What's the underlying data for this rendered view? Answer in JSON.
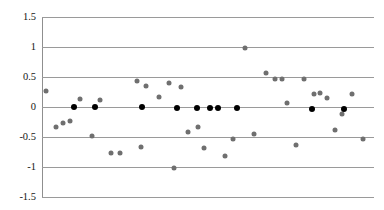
{
  "chart_data": {
    "type": "scatter",
    "title": "",
    "xlabel": "",
    "ylabel": "",
    "ylim": [
      -1.5,
      1.5
    ],
    "xlim": [
      0,
      100
    ],
    "grid": true,
    "legend": false,
    "ytick_labels": [
      "1.5",
      "1",
      "0.5",
      "0",
      "-0.5",
      "-1",
      "-1.5"
    ],
    "ytick_values": [
      1.5,
      1.0,
      0.5,
      0.0,
      -0.5,
      -1.0,
      -1.5
    ],
    "xtick_labels": [],
    "series": [
      {
        "name": "gray-points",
        "color": "#6f6f6f",
        "marker": "circle",
        "points": [
          {
            "x": 1.2,
            "y": 0.26
          },
          {
            "x": 4.2,
            "y": -0.33
          },
          {
            "x": 6.3,
            "y": -0.26
          },
          {
            "x": 8.4,
            "y": -0.24
          },
          {
            "x": 11.4,
            "y": 0.13
          },
          {
            "x": 15.1,
            "y": -0.49
          },
          {
            "x": 17.5,
            "y": 0.12
          },
          {
            "x": 20.8,
            "y": -0.76
          },
          {
            "x": 23.5,
            "y": -0.76
          },
          {
            "x": 28.6,
            "y": 0.43
          },
          {
            "x": 29.8,
            "y": -0.67
          },
          {
            "x": 31.3,
            "y": 0.35
          },
          {
            "x": 35.2,
            "y": 0.17
          },
          {
            "x": 38.2,
            "y": 0.4
          },
          {
            "x": 39.8,
            "y": -1.02
          },
          {
            "x": 41.8,
            "y": 0.33
          },
          {
            "x": 44.0,
            "y": -0.41
          },
          {
            "x": 46.9,
            "y": -0.34
          },
          {
            "x": 48.8,
            "y": -0.68
          },
          {
            "x": 55.0,
            "y": -0.82
          },
          {
            "x": 57.4,
            "y": -0.53
          },
          {
            "x": 61.0,
            "y": 0.99
          },
          {
            "x": 64.0,
            "y": -0.45
          },
          {
            "x": 67.6,
            "y": 0.56
          },
          {
            "x": 70.3,
            "y": 0.47
          },
          {
            "x": 72.4,
            "y": 0.47
          },
          {
            "x": 73.8,
            "y": 0.06
          },
          {
            "x": 76.5,
            "y": -0.64
          },
          {
            "x": 79.0,
            "y": 0.47
          },
          {
            "x": 81.9,
            "y": 0.22
          },
          {
            "x": 83.7,
            "y": 0.23
          },
          {
            "x": 85.8,
            "y": 0.15
          },
          {
            "x": 88.3,
            "y": -0.38
          },
          {
            "x": 90.4,
            "y": -0.12
          },
          {
            "x": 93.5,
            "y": 0.21
          },
          {
            "x": 96.6,
            "y": -0.53
          }
        ]
      },
      {
        "name": "black-points",
        "color": "#000000",
        "marker": "circle",
        "points": [
          {
            "x": 9.5,
            "y": 0.0
          },
          {
            "x": 16.1,
            "y": 0.0
          },
          {
            "x": 30.1,
            "y": 0.0
          },
          {
            "x": 40.6,
            "y": -0.02
          },
          {
            "x": 46.6,
            "y": -0.02
          },
          {
            "x": 50.7,
            "y": -0.02
          },
          {
            "x": 52.9,
            "y": -0.02
          },
          {
            "x": 58.7,
            "y": -0.02
          },
          {
            "x": 81.3,
            "y": -0.04
          },
          {
            "x": 91.1,
            "y": -0.04
          }
        ]
      }
    ]
  },
  "axis": {
    "y_axis_name": "y-axis",
    "plot_background": "#ffffff",
    "gridline_color": "#9a9a9a"
  }
}
